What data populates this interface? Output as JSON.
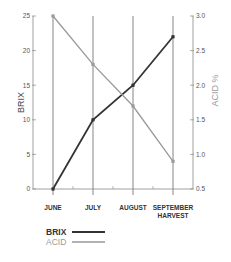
{
  "chart_data": {
    "type": "line",
    "title": "",
    "categories": [
      "JUNE",
      "JULY",
      "AUGUST",
      "SEPTEMBER HARVEST"
    ],
    "category_lines": [
      [
        "JUNE"
      ],
      [
        "JULY"
      ],
      [
        "AUGUST"
      ],
      [
        "SEPTEMBER",
        "HARVEST"
      ]
    ],
    "series": [
      {
        "name": "BRIX",
        "axis": "left",
        "values": [
          0,
          10,
          15,
          22
        ],
        "color": "#333333"
      },
      {
        "name": "ACID",
        "axis": "right",
        "values": [
          3.0,
          2.3,
          1.7,
          0.9
        ],
        "color": "#999999"
      }
    ],
    "left_axis": {
      "label": "BRIX",
      "ylim": [
        0,
        25
      ],
      "ticks": [
        0,
        5,
        10,
        15,
        20,
        25
      ]
    },
    "right_axis": {
      "label": "ACID %",
      "ylim": [
        0.5,
        3.0
      ],
      "ticks": [
        "0.5",
        "1.0",
        "1.5",
        "2.0",
        "2.5",
        "3.0"
      ]
    },
    "grid": "vertical lines at categories",
    "legend": {
      "position": "bottom",
      "entries": [
        "BRIX",
        "ACID"
      ]
    }
  }
}
